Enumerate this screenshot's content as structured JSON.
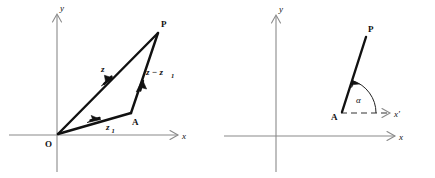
{
  "figure": {
    "background_color": "#ffffff",
    "axis_color": "#8a8a8a",
    "vector_color": "#111111",
    "dashed_color": "#333333"
  },
  "left_panel": {
    "name": "vector-triangle-diagram",
    "axes": {
      "y_label": "y",
      "x_label": "x"
    },
    "points": {
      "origin_label": "O",
      "p_label": "P",
      "a_label": "A"
    },
    "vectors": [
      {
        "id": "z",
        "label": "z",
        "subscript": "",
        "from": "O",
        "to": "P"
      },
      {
        "id": "z1",
        "label": "z",
        "subscript": "1",
        "from": "O",
        "to": "A"
      },
      {
        "id": "z-minus-z1",
        "label": "z − z",
        "subscript": "1",
        "from": "A",
        "to": "P"
      }
    ]
  },
  "right_panel": {
    "name": "argument-angle-diagram",
    "axes": {
      "y_label": "y",
      "x_label": "x",
      "x_prime_label": "x′"
    },
    "points": {
      "a_label": "A",
      "p_label": "P"
    },
    "angle": {
      "label": "α",
      "between": [
        "x′",
        "AP"
      ]
    }
  }
}
